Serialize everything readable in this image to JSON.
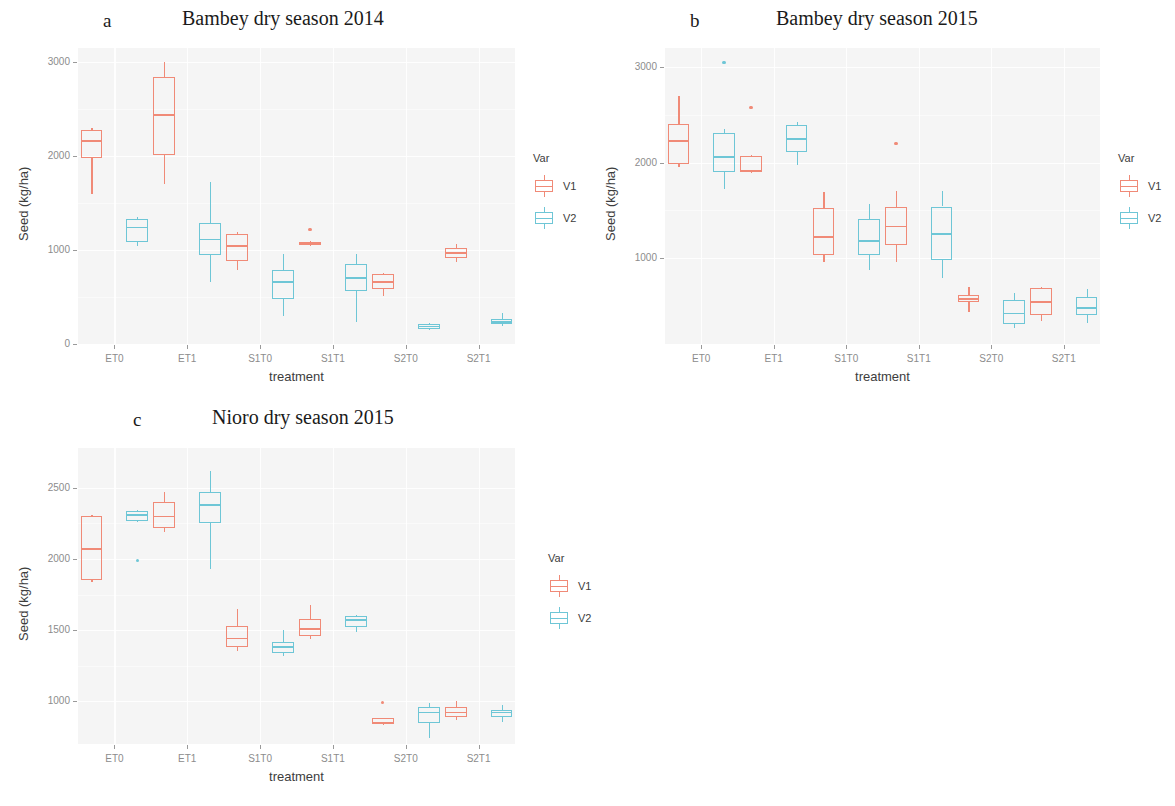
{
  "figure": {
    "x_axis_title": "treatment",
    "y_axis_title": "Seed (kg/ha)",
    "legend_title": "Var",
    "series_names": [
      "V1",
      "V2"
    ],
    "colors": {
      "V1": "#F08A77",
      "V2": "#6EC6D6",
      "panel_bg": "#f5f5f5",
      "grid": "#ffffff",
      "tick_text": "#8c8c8c",
      "axis_text": "#3d3d3d"
    }
  },
  "panels": [
    {
      "tag": "a",
      "title": "Bambey dry season 2014"
    },
    {
      "tag": "b",
      "title": "Bambey dry season 2015"
    },
    {
      "tag": "c",
      "title": "Nioro dry season 2015"
    }
  ],
  "chart_data": [
    {
      "type": "box",
      "panel": "a",
      "title": "Bambey dry season 2014",
      "xlabel": "treatment",
      "ylabel": "Seed (kg/ha)",
      "categories": [
        "ET0",
        "ET1",
        "S1T0",
        "S1T1",
        "S2T0",
        "S2T1"
      ],
      "yticks": [
        0,
        1000,
        2000,
        3000
      ],
      "ylim": [
        0,
        3150
      ],
      "grid": true,
      "legend": "right",
      "series": [
        {
          "name": "V1",
          "boxes": [
            {
              "category": "ET0",
              "min": 1600,
              "q1": 1980,
              "median": 2160,
              "q3": 2280,
              "max": 2300,
              "outliers": []
            },
            {
              "category": "ET1",
              "min": 1700,
              "q1": 2010,
              "median": 2440,
              "q3": 2840,
              "max": 3000,
              "outliers": []
            },
            {
              "category": "S1T0",
              "min": 790,
              "q1": 880,
              "median": 1040,
              "q3": 1170,
              "max": 1190,
              "outliers": []
            },
            {
              "category": "S1T1",
              "min": 1045,
              "q1": 1050,
              "median": 1070,
              "q3": 1090,
              "max": 1095,
              "outliers": [
                1220
              ]
            },
            {
              "category": "S2T0",
              "min": 510,
              "q1": 580,
              "median": 660,
              "q3": 740,
              "max": 755,
              "outliers": []
            },
            {
              "category": "S2T1",
              "min": 870,
              "q1": 910,
              "median": 970,
              "q3": 1020,
              "max": 1060,
              "outliers": []
            }
          ]
        },
        {
          "name": "V2",
          "boxes": [
            {
              "category": "ET0",
              "min": 1040,
              "q1": 1090,
              "median": 1240,
              "q3": 1330,
              "max": 1350,
              "outliers": []
            },
            {
              "category": "ET1",
              "min": 660,
              "q1": 950,
              "median": 1110,
              "q3": 1290,
              "max": 1720,
              "outliers": []
            },
            {
              "category": "S1T0",
              "min": 300,
              "q1": 480,
              "median": 660,
              "q3": 790,
              "max": 960,
              "outliers": []
            },
            {
              "category": "S1T1",
              "min": 230,
              "q1": 560,
              "median": 700,
              "q3": 850,
              "max": 960,
              "outliers": []
            },
            {
              "category": "S2T0",
              "min": 150,
              "q1": 160,
              "median": 185,
              "q3": 215,
              "max": 225,
              "outliers": []
            },
            {
              "category": "S2T1",
              "min": 195,
              "q1": 210,
              "median": 235,
              "q3": 265,
              "max": 330,
              "outliers": []
            }
          ]
        }
      ]
    },
    {
      "type": "box",
      "panel": "b",
      "title": "Bambey dry season 2015",
      "xlabel": "treatment",
      "ylabel": "Seed (kg/ha)",
      "categories": [
        "ET0",
        "ET1",
        "S1T0",
        "S1T1",
        "S2T0",
        "S2T1"
      ],
      "yticks": [
        1000,
        2000,
        3000
      ],
      "ylim": [
        100,
        3200
      ],
      "grid": true,
      "legend": "right",
      "series": [
        {
          "name": "V1",
          "boxes": [
            {
              "category": "ET0",
              "min": 1950,
              "q1": 1990,
              "median": 2225,
              "q3": 2400,
              "max": 2700,
              "outliers": []
            },
            {
              "category": "ET1",
              "min": 1900,
              "q1": 1905,
              "median": 1915,
              "q3": 2070,
              "max": 2075,
              "outliers": [
                2580
              ]
            },
            {
              "category": "S1T0",
              "min": 960,
              "q1": 1030,
              "median": 1220,
              "q3": 1520,
              "max": 1690,
              "outliers": []
            },
            {
              "category": "S1T1",
              "min": 960,
              "q1": 1140,
              "median": 1330,
              "q3": 1530,
              "max": 1700,
              "outliers": [
                2200
              ]
            },
            {
              "category": "S2T0",
              "min": 430,
              "q1": 540,
              "median": 570,
              "q3": 610,
              "max": 700,
              "outliers": []
            },
            {
              "category": "S2T1",
              "min": 340,
              "q1": 400,
              "median": 540,
              "q3": 690,
              "max": 700,
              "outliers": []
            }
          ]
        },
        {
          "name": "V2",
          "boxes": [
            {
              "category": "ET0",
              "min": 1720,
              "q1": 1900,
              "median": 2060,
              "q3": 2310,
              "max": 2350,
              "outliers": [
                3050
              ]
            },
            {
              "category": "ET1",
              "min": 1970,
              "q1": 2110,
              "median": 2250,
              "q3": 2390,
              "max": 2430,
              "outliers": []
            },
            {
              "category": "S1T0",
              "min": 870,
              "q1": 1030,
              "median": 1180,
              "q3": 1410,
              "max": 1570,
              "outliers": []
            },
            {
              "category": "S1T1",
              "min": 790,
              "q1": 980,
              "median": 1250,
              "q3": 1540,
              "max": 1700,
              "outliers": []
            },
            {
              "category": "S2T0",
              "min": 270,
              "q1": 310,
              "median": 420,
              "q3": 560,
              "max": 630,
              "outliers": []
            },
            {
              "category": "S2T1",
              "min": 320,
              "q1": 400,
              "median": 480,
              "q3": 590,
              "max": 680,
              "outliers": []
            }
          ]
        }
      ]
    },
    {
      "type": "box",
      "panel": "c",
      "title": "Nioro dry season 2015",
      "xlabel": "treatment",
      "ylabel": "Seed (kg/ha)",
      "categories": [
        "ET0",
        "ET1",
        "S1T0",
        "S1T1",
        "S2T0",
        "S2T1"
      ],
      "yticks": [
        1000,
        1500,
        2000,
        2500
      ],
      "ylim": [
        700,
        2780
      ],
      "grid": true,
      "legend": "right",
      "series": [
        {
          "name": "V1",
          "boxes": [
            {
              "category": "ET0",
              "min": 1840,
              "q1": 1850,
              "median": 2070,
              "q3": 2300,
              "max": 2310,
              "outliers": []
            },
            {
              "category": "ET1",
              "min": 2190,
              "q1": 2220,
              "median": 2300,
              "q3": 2400,
              "max": 2470,
              "outliers": []
            },
            {
              "category": "S1T0",
              "min": 1350,
              "q1": 1380,
              "median": 1440,
              "q3": 1530,
              "max": 1650,
              "outliers": []
            },
            {
              "category": "S1T1",
              "min": 1440,
              "q1": 1460,
              "median": 1510,
              "q3": 1580,
              "max": 1680,
              "outliers": []
            },
            {
              "category": "S2T0",
              "min": 835,
              "q1": 840,
              "median": 850,
              "q3": 880,
              "max": 885,
              "outliers": [
                990
              ]
            },
            {
              "category": "S2T1",
              "min": 870,
              "q1": 890,
              "median": 920,
              "q3": 960,
              "max": 1000,
              "outliers": []
            }
          ]
        },
        {
          "name": "V2",
          "boxes": [
            {
              "category": "ET0",
              "min": 2265,
              "q1": 2270,
              "median": 2310,
              "q3": 2340,
              "max": 2345,
              "outliers": [
                1990
              ]
            },
            {
              "category": "ET1",
              "min": 1930,
              "q1": 2250,
              "median": 2380,
              "q3": 2470,
              "max": 2620,
              "outliers": []
            },
            {
              "category": "S1T0",
              "min": 1320,
              "q1": 1340,
              "median": 1380,
              "q3": 1420,
              "max": 1500,
              "outliers": []
            },
            {
              "category": "S1T1",
              "min": 1490,
              "q1": 1520,
              "median": 1570,
              "q3": 1600,
              "max": 1610,
              "outliers": []
            },
            {
              "category": "S2T0",
              "min": 740,
              "q1": 845,
              "median": 920,
              "q3": 960,
              "max": 985,
              "outliers": []
            },
            {
              "category": "S2T1",
              "min": 855,
              "q1": 890,
              "median": 920,
              "q3": 940,
              "max": 975,
              "outliers": []
            }
          ]
        }
      ]
    }
  ],
  "layout": {
    "panels": [
      {
        "tag_x": 103,
        "tag_y": 10,
        "title_x": 182,
        "title_y": 7,
        "plot_x": 78,
        "plot_y": 48,
        "plot_w": 437,
        "plot_h": 296,
        "legend_x": 533,
        "legend_y": 152
      },
      {
        "tag_x": 690,
        "tag_y": 10,
        "title_x": 776,
        "title_y": 7,
        "plot_x": 665,
        "plot_y": 48,
        "plot_w": 435,
        "plot_h": 296,
        "legend_x": 1118,
        "legend_y": 152
      },
      {
        "tag_x": 133,
        "tag_y": 409,
        "title_x": 212,
        "title_y": 406,
        "plot_x": 78,
        "plot_y": 448,
        "plot_w": 437,
        "plot_h": 296,
        "legend_x": 548,
        "legend_y": 552
      }
    ]
  }
}
